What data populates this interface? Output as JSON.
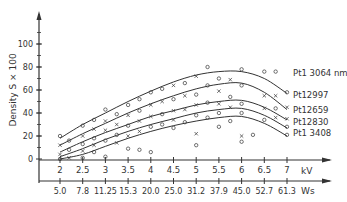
{
  "chart_data": {
    "type": "line",
    "title": "",
    "ylabel": "Density S × 100",
    "xlabel": "kV",
    "xlabel2": "Ws",
    "ylim": [
      -15,
      115
    ],
    "xlim": [
      1.6,
      7.8
    ],
    "yticks": [
      0,
      20,
      40,
      60,
      80,
      100
    ],
    "xticks_kv": [
      2,
      2.5,
      3,
      3.5,
      4,
      4.5,
      5,
      5.5,
      6,
      6.5,
      7
    ],
    "xticks_kv_labels": [
      "2",
      "2.5",
      "3",
      "3.5",
      "4",
      "4.5",
      "5",
      "5.5",
      "6",
      "6.5",
      "7"
    ],
    "xticks_ws_labels": [
      "5.0",
      "7.8",
      "11.25",
      "15.3",
      "20.0",
      "25.0",
      "31.2",
      "37.9",
      "45.0",
      "52.7",
      "61.3"
    ],
    "grid": false,
    "legend_position": "inline-right",
    "x": [
      2,
      2.5,
      3,
      3.5,
      4,
      4.5,
      5,
      5.5,
      6,
      6.5,
      7
    ],
    "series": [
      {
        "name": "Pt1 3064 nm",
        "marker": "o",
        "values": [
          18,
          30,
          40,
          50,
          59,
          67,
          73,
          76,
          76,
          70,
          57
        ]
      },
      {
        "name": "Pt12997",
        "marker": "x",
        "values": [
          12,
          22,
          31,
          40,
          48,
          55,
          61,
          65,
          66,
          58,
          43
        ]
      },
      {
        "name": "Pt12659",
        "marker": "o",
        "values": [
          6,
          15,
          23,
          30,
          37,
          42,
          47,
          50,
          51,
          45,
          34
        ]
      },
      {
        "name": "Pt12830",
        "marker": "x",
        "values": [
          2,
          9,
          17,
          24,
          30,
          35,
          40,
          43,
          44,
          38,
          27
        ]
      },
      {
        "name": "Pt1 3408",
        "marker": "o",
        "values": [
          0,
          4,
          11,
          18,
          24,
          29,
          33,
          36,
          37,
          31,
          20
        ]
      }
    ],
    "scatter_points": [
      {
        "x": 2,
        "y": 20,
        "m": "o"
      },
      {
        "x": 2,
        "y": 12,
        "m": "x"
      },
      {
        "x": 2,
        "y": 4,
        "m": "x"
      },
      {
        "x": 2,
        "y": 0,
        "m": "o"
      },
      {
        "x": 2.2,
        "y": 16,
        "m": "o"
      },
      {
        "x": 2.2,
        "y": 8,
        "m": "o"
      },
      {
        "x": 2.2,
        "y": 1,
        "m": "x"
      },
      {
        "x": 2.5,
        "y": 29,
        "m": "o"
      },
      {
        "x": 2.5,
        "y": 20,
        "m": "x"
      },
      {
        "x": 2.5,
        "y": 13,
        "m": "o"
      },
      {
        "x": 2.5,
        "y": 7,
        "m": "x"
      },
      {
        "x": 2.5,
        "y": 1,
        "m": "o"
      },
      {
        "x": 2.75,
        "y": 34,
        "m": "o"
      },
      {
        "x": 2.75,
        "y": 26,
        "m": "x"
      },
      {
        "x": 2.75,
        "y": 18,
        "m": "o"
      },
      {
        "x": 2.75,
        "y": 12,
        "m": "x"
      },
      {
        "x": 2.75,
        "y": 6,
        "m": "o"
      },
      {
        "x": 3,
        "y": 43,
        "m": "o"
      },
      {
        "x": 3,
        "y": 33,
        "m": "x"
      },
      {
        "x": 3,
        "y": 25,
        "m": "x"
      },
      {
        "x": 3,
        "y": 16,
        "m": "o"
      },
      {
        "x": 3,
        "y": 2,
        "m": "o"
      },
      {
        "x": 3.25,
        "y": 39,
        "m": "o"
      },
      {
        "x": 3.25,
        "y": 30,
        "m": "x"
      },
      {
        "x": 3.25,
        "y": 21,
        "m": "o"
      },
      {
        "x": 3.25,
        "y": 14,
        "m": "x"
      },
      {
        "x": 3.5,
        "y": 47,
        "m": "o"
      },
      {
        "x": 3.5,
        "y": 38,
        "m": "x"
      },
      {
        "x": 3.5,
        "y": 29,
        "m": "o"
      },
      {
        "x": 3.5,
        "y": 20,
        "m": "x"
      },
      {
        "x": 3.5,
        "y": 9,
        "m": "o"
      },
      {
        "x": 3.75,
        "y": 52,
        "m": "o"
      },
      {
        "x": 3.75,
        "y": 42,
        "m": "o"
      },
      {
        "x": 3.75,
        "y": 33,
        "m": "x"
      },
      {
        "x": 3.75,
        "y": 24,
        "m": "x"
      },
      {
        "x": 3.75,
        "y": 8,
        "m": "o"
      },
      {
        "x": 4,
        "y": 58,
        "m": "o"
      },
      {
        "x": 4,
        "y": 47,
        "m": "x"
      },
      {
        "x": 4,
        "y": 37,
        "m": "x"
      },
      {
        "x": 4,
        "y": 28,
        "m": "o"
      },
      {
        "x": 4,
        "y": 6,
        "m": "o"
      },
      {
        "x": 4.25,
        "y": 61,
        "m": "o"
      },
      {
        "x": 4.25,
        "y": 50,
        "m": "x"
      },
      {
        "x": 4.25,
        "y": 39,
        "m": "o"
      },
      {
        "x": 4.25,
        "y": 30,
        "m": "o"
      },
      {
        "x": 4.5,
        "y": 64,
        "m": "x"
      },
      {
        "x": 4.5,
        "y": 52,
        "m": "o"
      },
      {
        "x": 4.5,
        "y": 42,
        "m": "x"
      },
      {
        "x": 4.5,
        "y": 34,
        "m": "x"
      },
      {
        "x": 4.5,
        "y": 27,
        "m": "o"
      },
      {
        "x": 4.75,
        "y": 66,
        "m": "o"
      },
      {
        "x": 4.75,
        "y": 55,
        "m": "x"
      },
      {
        "x": 4.75,
        "y": 43,
        "m": "x"
      },
      {
        "x": 4.75,
        "y": 32,
        "m": "o"
      },
      {
        "x": 5,
        "y": 72,
        "m": "x"
      },
      {
        "x": 5,
        "y": 56,
        "m": "o"
      },
      {
        "x": 5,
        "y": 47,
        "m": "x"
      },
      {
        "x": 5,
        "y": 38,
        "m": "o"
      },
      {
        "x": 5,
        "y": 22,
        "m": "x"
      },
      {
        "x": 5,
        "y": 12,
        "m": "o"
      },
      {
        "x": 5.25,
        "y": 80,
        "m": "o"
      },
      {
        "x": 5.25,
        "y": 64,
        "m": "o"
      },
      {
        "x": 5.25,
        "y": 49,
        "m": "o"
      },
      {
        "x": 5.25,
        "y": 36,
        "m": "o"
      },
      {
        "x": 5.5,
        "y": 70,
        "m": "o"
      },
      {
        "x": 5.5,
        "y": 59,
        "m": "x"
      },
      {
        "x": 5.5,
        "y": 48,
        "m": "x"
      },
      {
        "x": 5.5,
        "y": 40,
        "m": "o"
      },
      {
        "x": 5.5,
        "y": 28,
        "m": "o"
      },
      {
        "x": 5.75,
        "y": 69,
        "m": "x"
      },
      {
        "x": 5.75,
        "y": 54,
        "m": "o"
      },
      {
        "x": 5.75,
        "y": 45,
        "m": "x"
      },
      {
        "x": 5.75,
        "y": 33,
        "m": "o"
      },
      {
        "x": 6,
        "y": 78,
        "m": "o"
      },
      {
        "x": 6,
        "y": 64,
        "m": "o"
      },
      {
        "x": 6,
        "y": 48,
        "m": "o"
      },
      {
        "x": 6,
        "y": 40,
        "m": "o"
      },
      {
        "x": 6,
        "y": 20,
        "m": "x"
      },
      {
        "x": 6,
        "y": 15,
        "m": "o"
      },
      {
        "x": 6.25,
        "y": 21,
        "m": "o"
      },
      {
        "x": 6.5,
        "y": 76,
        "m": "o"
      },
      {
        "x": 6.5,
        "y": 55,
        "m": "x"
      },
      {
        "x": 6.5,
        "y": 44,
        "m": "x"
      },
      {
        "x": 6.5,
        "y": 34,
        "m": "o"
      },
      {
        "x": 6.75,
        "y": 76,
        "m": "o"
      },
      {
        "x": 6.75,
        "y": 55,
        "m": "x"
      },
      {
        "x": 6.75,
        "y": 44,
        "m": "o"
      },
      {
        "x": 6.75,
        "y": 36,
        "m": "x"
      },
      {
        "x": 7,
        "y": 58,
        "m": "o"
      },
      {
        "x": 7,
        "y": 45,
        "m": "x"
      },
      {
        "x": 7,
        "y": 35,
        "m": "x"
      },
      {
        "x": 7,
        "y": 28,
        "m": "o"
      },
      {
        "x": 7,
        "y": 21,
        "m": "o"
      }
    ]
  },
  "colors": {
    "ink": "#333333",
    "background": "#ffffff"
  }
}
